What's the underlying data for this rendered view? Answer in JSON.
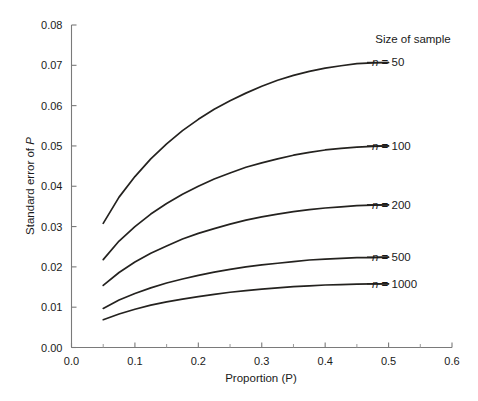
{
  "chart_data": {
    "type": "line",
    "title": "",
    "xlabel": "Proportion (P)",
    "ylabel": "Standard error of P",
    "xlim": [
      0.0,
      0.6
    ],
    "ylim": [
      0.0,
      0.08
    ],
    "grid": false,
    "legend_position": "right-inline",
    "legend_title": "Size of sample",
    "x_ticks": [
      "0.0",
      "0.1",
      "0.2",
      "0.3",
      "0.4",
      "0.5",
      "0.6"
    ],
    "x_tick_values": [
      0.0,
      0.1,
      0.2,
      0.3,
      0.4,
      0.5,
      0.6
    ],
    "x_minor_tick_values": [
      0.05,
      0.15,
      0.25,
      0.35,
      0.45,
      0.55
    ],
    "y_ticks": [
      "0.00",
      "0.01",
      "0.02",
      "0.03",
      "0.04",
      "0.05",
      "0.06",
      "0.07",
      "0.08"
    ],
    "y_tick_values": [
      0.0,
      0.01,
      0.02,
      0.03,
      0.04,
      0.05,
      0.06,
      0.07,
      0.08
    ],
    "x": [
      0.05,
      0.075,
      0.1,
      0.125,
      0.15,
      0.175,
      0.2,
      0.225,
      0.25,
      0.275,
      0.3,
      0.325,
      0.35,
      0.375,
      0.4,
      0.425,
      0.45,
      0.475,
      0.5
    ],
    "series": [
      {
        "name": "n = 50",
        "n": 50,
        "label": "n = 50",
        "label_italic": "n",
        "label_rest": " = 50",
        "values": [
          0.0308,
          0.0373,
          0.0424,
          0.0468,
          0.0505,
          0.0538,
          0.0566,
          0.0591,
          0.0612,
          0.0631,
          0.0648,
          0.0663,
          0.0675,
          0.0685,
          0.0693,
          0.0699,
          0.0704,
          0.0706,
          0.0707
        ]
      },
      {
        "name": "n = 100",
        "n": 100,
        "label": "n = 100",
        "label_italic": "n",
        "label_rest": " = 100",
        "values": [
          0.0218,
          0.0264,
          0.03,
          0.0331,
          0.0357,
          0.038,
          0.04,
          0.0418,
          0.0433,
          0.0447,
          0.0458,
          0.0468,
          0.0477,
          0.0484,
          0.049,
          0.0494,
          0.0497,
          0.0499,
          0.05
        ]
      },
      {
        "name": "n = 200",
        "n": 200,
        "label": "n = 200",
        "label_italic": "n",
        "label_rest": " = 200",
        "values": [
          0.0154,
          0.0186,
          0.0212,
          0.0234,
          0.0252,
          0.0269,
          0.0283,
          0.0295,
          0.0306,
          0.0316,
          0.0324,
          0.0331,
          0.0337,
          0.0342,
          0.0346,
          0.0349,
          0.0352,
          0.0353,
          0.0354
        ]
      },
      {
        "name": "n = 500",
        "n": 500,
        "label": "n = 500",
        "label_italic": "n",
        "label_rest": " = 500",
        "values": [
          0.0097,
          0.0118,
          0.0134,
          0.0148,
          0.016,
          0.017,
          0.0179,
          0.0187,
          0.0194,
          0.02,
          0.0205,
          0.0209,
          0.0213,
          0.0217,
          0.0219,
          0.0221,
          0.0223,
          0.0223,
          0.0224
        ]
      },
      {
        "name": "n = 1000",
        "n": 1000,
        "label": "n = 1000",
        "label_italic": "n",
        "label_rest": " = 1000",
        "values": [
          0.0069,
          0.0083,
          0.0095,
          0.0105,
          0.0113,
          0.012,
          0.0126,
          0.0132,
          0.0137,
          0.0141,
          0.0145,
          0.0148,
          0.0151,
          0.0153,
          0.0155,
          0.0156,
          0.0157,
          0.0158,
          0.0158
        ]
      }
    ]
  },
  "axes": {
    "x_title": "Proportion (P)",
    "y_title_prefix": "Standard error of ",
    "y_title_italic": "P",
    "x_tick_0": "0.0",
    "x_tick_1": "0.1",
    "x_tick_2": "0.2",
    "x_tick_3": "0.3",
    "x_tick_4": "0.4",
    "x_tick_5": "0.5",
    "x_tick_6": "0.6",
    "y_tick_0": "0.00",
    "y_tick_1": "0.01",
    "y_tick_2": "0.02",
    "y_tick_3": "0.03",
    "y_tick_4": "0.04",
    "y_tick_5": "0.05",
    "y_tick_6": "0.06",
    "y_tick_7": "0.07",
    "y_tick_8": "0.08"
  },
  "legend": {
    "title": "Size of sample",
    "items": [
      {
        "italic": "n",
        "rest": " = 50"
      },
      {
        "italic": "n",
        "rest": " = 100"
      },
      {
        "italic": "n",
        "rest": " = 200"
      },
      {
        "italic": "n",
        "rest": " = 500"
      },
      {
        "italic": "n",
        "rest": " = 1000"
      }
    ]
  },
  "style": {
    "background": "#ffffff",
    "curve_color": "#24221f",
    "axis_color": "#7a7a7a",
    "text_color": "#1a1a1a"
  }
}
